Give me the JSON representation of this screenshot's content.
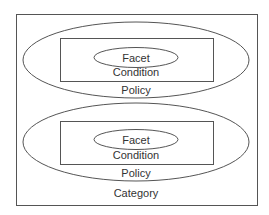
{
  "diagram": {
    "colors": {
      "stroke": "#555555",
      "text": "#333333",
      "background": "#ffffff"
    },
    "category": {
      "label": "Category"
    },
    "policies": [
      {
        "label": "Policy",
        "condition": {
          "label": "Condition",
          "facet": {
            "label": "Facet"
          }
        }
      },
      {
        "label": "Policy",
        "condition": {
          "label": "Condition",
          "facet": {
            "label": "Facet"
          }
        }
      }
    ]
  }
}
